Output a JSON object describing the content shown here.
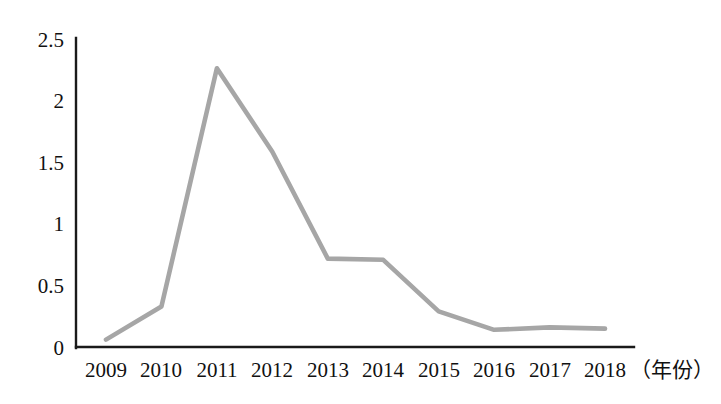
{
  "chart_data": {
    "type": "line",
    "title": "",
    "subtitle": "",
    "xlabel": "（年份）",
    "ylabel": "",
    "categories": [
      "2009",
      "2010",
      "2011",
      "2012",
      "2013",
      "2014",
      "2015",
      "2016",
      "2017",
      "2018"
    ],
    "values": [
      0.06,
      0.33,
      2.27,
      1.59,
      0.72,
      0.71,
      0.29,
      0.14,
      0.16,
      0.15
    ],
    "series": [
      {
        "name": "",
        "values": [
          0.06,
          0.33,
          2.27,
          1.59,
          0.72,
          0.71,
          0.29,
          0.14,
          0.16,
          0.15
        ]
      }
    ],
    "xlim": [
      "2009",
      "2018"
    ],
    "ylim": [
      0,
      2.5
    ],
    "y_ticks": [
      "0",
      "0.5",
      "1",
      "1.5",
      "2",
      "2.5"
    ],
    "y_tick_values": [
      0,
      0.5,
      1,
      1.5,
      2,
      2.5
    ],
    "x_ticks": [
      "2009",
      "2010",
      "2011",
      "2012",
      "2013",
      "2014",
      "2015",
      "2016",
      "2017",
      "2018"
    ],
    "grid": false,
    "legend": false,
    "legend_position": "none",
    "markers": false,
    "annotations": [],
    "colors": {
      "line": "#a6a6a6",
      "axis": "#1a1a1a",
      "text": "#111111",
      "background": "#ffffff"
    }
  },
  "axis_caption": {
    "x_unit_label": "（年份）"
  }
}
